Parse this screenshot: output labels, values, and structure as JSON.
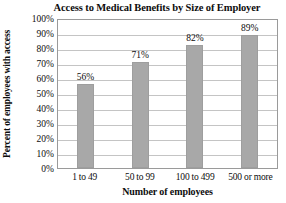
{
  "chart_data": {
    "type": "bar",
    "title": "Access to Medical Benefits by Size of Employer",
    "xlabel": "Number of employees",
    "ylabel": "Percent of employees with access",
    "categories": [
      "1 to 49",
      "50 to 99",
      "100 to 499",
      "500 or more"
    ],
    "values": [
      56,
      71,
      82,
      89
    ],
    "value_labels": [
      "56%",
      "71%",
      "82%",
      "89%"
    ],
    "ylim": [
      0,
      100
    ],
    "ytick_values": [
      100,
      90,
      80,
      70,
      60,
      50,
      40,
      30,
      20,
      10,
      0
    ],
    "ytick_labels": [
      "100%",
      "90%",
      "80%",
      "70%",
      "60%",
      "50%",
      "40%",
      "30%",
      "20%",
      "10%",
      "0%"
    ],
    "grid": true,
    "legend": "none",
    "bar_color": "#a8a8a8",
    "grid_color": "#c4c4c4",
    "axis_color": "#9a9a9a",
    "background_color": "#ffffff"
  }
}
